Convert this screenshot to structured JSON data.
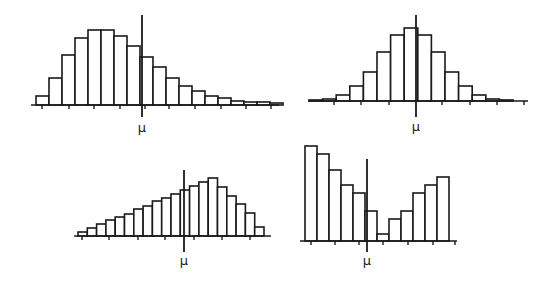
{
  "chart_data": [
    {
      "type": "bar",
      "title": "Right-skewed distribution",
      "position": "top-left",
      "mean_label": "μ",
      "xlabel": "",
      "ylabel": "",
      "grid": false,
      "bar_heights_relative": [
        9,
        27,
        50,
        67,
        75,
        75,
        69,
        59,
        48,
        38,
        27,
        19,
        14,
        9,
        7,
        4,
        3,
        3,
        2
      ],
      "layout": {
        "x0": 36,
        "bar_width": 13,
        "baseline": 105,
        "scale": 1.0,
        "axis_x1": 31,
        "axis_x2": 279,
        "mean_x": 142,
        "mean_y1": 15,
        "mean_y2": 117,
        "mu_y": 132,
        "ticks": [
          42,
          69,
          94,
          120,
          145,
          169,
          195,
          221,
          246,
          271
        ]
      }
    },
    {
      "type": "bar",
      "title": "Symmetric (bell-shaped) distribution",
      "position": "top-right",
      "mean_label": "μ",
      "xlabel": "",
      "ylabel": "",
      "grid": false,
      "bar_heights_relative": [
        1,
        2,
        6,
        15,
        29,
        49,
        66,
        73,
        66,
        49,
        29,
        15,
        6,
        2,
        1
      ],
      "layout": {
        "x0": 309,
        "bar_width": 13.6,
        "baseline": 101,
        "scale": 1.0,
        "axis_x1": 308,
        "axis_x2": 528,
        "mean_x": 416,
        "mean_y1": 15,
        "mean_y2": 117,
        "mu_y": 131,
        "ticks": [
          334,
          361,
          389,
          442,
          470,
          497,
          524
        ]
      }
    },
    {
      "type": "bar",
      "title": "Left-skewed distribution",
      "position": "bottom-left",
      "mean_label": "μ",
      "xlabel": "",
      "ylabel": "",
      "grid": false,
      "bar_heights_relative": [
        4,
        8,
        12,
        16,
        19,
        22,
        27,
        30,
        35,
        38,
        42,
        46,
        50,
        54,
        58,
        49,
        40,
        32,
        23,
        9
      ],
      "layout": {
        "x0": 78,
        "bar_width": 9.3,
        "baseline": 236,
        "scale": 1.0,
        "axis_x1": 74,
        "axis_x2": 271,
        "mean_x": 184,
        "mean_y1": 170,
        "mean_y2": 252,
        "mu_y": 265,
        "ticks": [
          82,
          109,
          138,
          165,
          194,
          222,
          250
        ]
      }
    },
    {
      "type": "bar",
      "title": "Bimodal distribution",
      "position": "bottom-right",
      "mean_label": "μ",
      "xlabel": "",
      "ylabel": "",
      "grid": false,
      "bar_heights_relative": [
        95,
        87,
        71,
        56,
        48,
        30,
        7,
        22,
        30,
        48,
        56,
        64
      ],
      "layout": {
        "x0": 305,
        "bar_width": 12,
        "baseline": 241,
        "scale": 1.0,
        "axis_x1": 300,
        "axis_x2": 457,
        "mean_x": 367,
        "mean_y1": 159,
        "mean_y2": 252,
        "mu_y": 265,
        "ticks": [
          311,
          335,
          359,
          383,
          408,
          433,
          455
        ]
      }
    }
  ]
}
